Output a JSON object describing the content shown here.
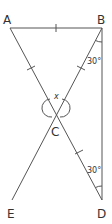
{
  "diagram": {
    "points": {
      "A": {
        "label": "A",
        "x": 10,
        "y": 28
      },
      "B": {
        "label": "B",
        "x": 102,
        "y": 28
      },
      "C": {
        "label": "C",
        "x": 56,
        "y": 108
      },
      "D": {
        "label": "D",
        "x": 102,
        "y": 200
      },
      "E": {
        "label": "E",
        "x": 12,
        "y": 200
      }
    },
    "segments": [
      "AB",
      "AC",
      "BC",
      "CD",
      "CE",
      "BD"
    ],
    "equal_marks": [
      "AB",
      "AC",
      "BC",
      "CD"
    ],
    "angles": {
      "B": {
        "label": "30°"
      },
      "D": {
        "label": "30°"
      },
      "C": {
        "label": "x"
      }
    }
  }
}
